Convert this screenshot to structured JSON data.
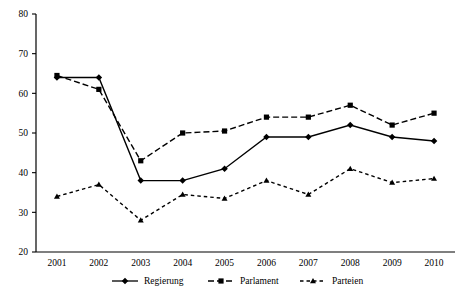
{
  "chart_data": {
    "type": "line",
    "title": "",
    "subtitle": "",
    "xlabel": "",
    "ylabel": "",
    "categories": [
      "2001",
      "2002",
      "2003",
      "2004",
      "2005",
      "2006",
      "2007",
      "2008",
      "2009",
      "2010"
    ],
    "x": [
      2001,
      2002,
      2003,
      2004,
      2005,
      2006,
      2007,
      2008,
      2009,
      2010
    ],
    "ylim": [
      20,
      80
    ],
    "yticks": [
      20,
      30,
      40,
      50,
      60,
      70,
      80
    ],
    "ytick_labels": [
      "20",
      "30",
      "40",
      "50",
      "60",
      "70",
      "80"
    ],
    "grid": false,
    "legend_position": "bottom",
    "series": [
      {
        "name": "Regierung",
        "marker": "diamond",
        "line_style": "solid",
        "color": "#000000",
        "values": [
          64,
          64,
          38,
          38,
          41,
          49,
          49,
          52,
          49,
          48
        ]
      },
      {
        "name": "Parlament",
        "marker": "square",
        "line_style": "dashed",
        "color": "#000000",
        "values": [
          64.5,
          61,
          43,
          50,
          50.5,
          54,
          54,
          57,
          52,
          55
        ]
      },
      {
        "name": "Parteien",
        "marker": "triangle",
        "line_style": "dotted",
        "color": "#000000",
        "values": [
          34,
          37,
          28,
          34.5,
          33.5,
          38,
          34.5,
          41,
          37.5,
          38.5
        ]
      }
    ]
  },
  "legend": {
    "items": [
      {
        "label": "Regierung",
        "marker": "diamond",
        "line_style": "solid"
      },
      {
        "label": "Parlament",
        "marker": "square",
        "line_style": "dashed"
      },
      {
        "label": "Parteien",
        "marker": "triangle",
        "line_style": "dotted"
      }
    ]
  }
}
